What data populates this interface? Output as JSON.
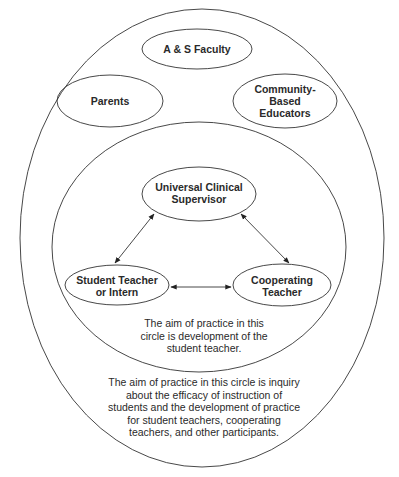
{
  "diagram": {
    "outer_circle": {
      "participants": [
        "A & S Faculty",
        "Parents",
        "Community-Based Educators"
      ],
      "caption_lines": [
        "The aim of practice in this circle is inquiry",
        "about the efficacy of instruction of",
        "students and the development of practice",
        "for student teachers, cooperating",
        "teachers, and other participants."
      ]
    },
    "inner_circle": {
      "caption_lines": [
        "The aim of practice in this",
        "circle is development of the",
        "student teacher."
      ]
    },
    "nodes": {
      "as_faculty": "A & S Faculty",
      "parents": "Parents",
      "community_1": "Community-",
      "community_2": "Based",
      "community_3": "Educators",
      "supervisor_1": "Universal Clinical",
      "supervisor_2": "Supervisor",
      "student_1": "Student Teacher",
      "student_2": "or Intern",
      "cooperating_1": "Cooperating",
      "cooperating_2": "Teacher"
    },
    "edges": [
      {
        "from": "Universal Clinical Supervisor",
        "to": "Student Teacher or Intern",
        "type": "bidirectional"
      },
      {
        "from": "Universal Clinical Supervisor",
        "to": "Cooperating Teacher",
        "type": "bidirectional"
      },
      {
        "from": "Student Teacher or Intern",
        "to": "Cooperating Teacher",
        "type": "bidirectional"
      }
    ],
    "colors": {
      "stroke": "#333333",
      "background": "#ffffff"
    }
  }
}
